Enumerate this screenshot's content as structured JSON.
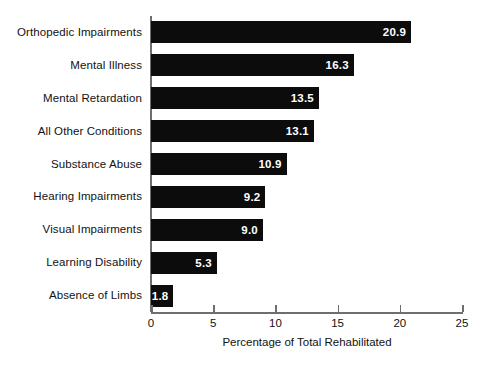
{
  "chart_data": {
    "type": "bar",
    "orientation": "horizontal",
    "title": "",
    "xlabel": "Percentage of Total Rehabilitated",
    "ylabel": "",
    "xlim": [
      0,
      25
    ],
    "xticks": [
      0,
      5,
      10,
      15,
      20,
      25
    ],
    "xtick_labels": [
      "0",
      "5",
      "10",
      "15",
      "20",
      "25"
    ],
    "grid": false,
    "legend": false,
    "bar_color": "#0c0c0c",
    "value_label_color": "#ffffff",
    "axis_color": "#6e6e6e",
    "categories": [
      "Orthopedic Impairments",
      "Mental Illness",
      "Mental Retardation",
      "All Other Conditions",
      "Substance Abuse",
      "Hearing Impairments",
      "Visual Impairments",
      "Learning Disability",
      "Absence of Limbs"
    ],
    "values": [
      20.9,
      16.3,
      13.5,
      13.1,
      10.9,
      9.2,
      9.0,
      5.3,
      1.8
    ],
    "value_labels": [
      "20.9",
      "16.3",
      "13.5",
      "13.1",
      "10.9",
      "9.2",
      "9.0",
      "5.3",
      "1.8"
    ]
  }
}
